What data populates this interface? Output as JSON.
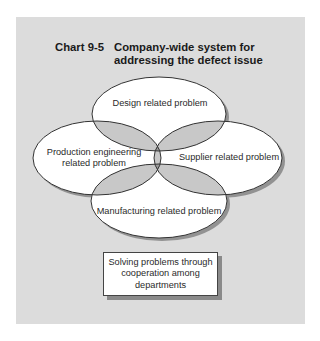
{
  "chart": {
    "number": "Chart 9-5",
    "title_line1": "Company-wide system for",
    "title_line2": "addressing the defect issue"
  },
  "ellipses": {
    "top": {
      "label": "Design related problem"
    },
    "left": {
      "label_line1": "Production engineering",
      "label_line2": "related problem"
    },
    "right": {
      "label": "Supplier related problem"
    },
    "bottom": {
      "label": "Manufacturing related problem"
    }
  },
  "result_box": {
    "line1": "Solving problems through",
    "line2": "cooperation among",
    "line3": "departments"
  },
  "colors": {
    "panel": "#dcdcdc",
    "ellipse_fill": "#ffffff",
    "pair_overlap": "#c8c8c8",
    "triple_overlap": "#9a9a9a",
    "center": "#1e1e1e"
  }
}
